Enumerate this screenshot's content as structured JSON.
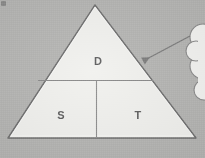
{
  "figure": {
    "type": "pyramid-diagram",
    "title": "",
    "background_color": "#b5b5b3",
    "shape_fill_color": "#f1f1ee",
    "shape_stroke_color": "#6f6f6f",
    "label_color": "#5e5e5e",
    "annotation_color": "#7d7d7d"
  },
  "pyramid": {
    "apex": {
      "x": 95,
      "y": 5
    },
    "base_left": {
      "x": 8,
      "y": 138
    },
    "base_right": {
      "x": 196,
      "y": 138
    },
    "horizontal_divider_y": 80,
    "vertical_divider_x": 96,
    "sections": [
      {
        "id": "top",
        "label": "D",
        "label_x": 98,
        "label_y": 61
      },
      {
        "id": "bottom-left",
        "label": "S",
        "label_x": 61,
        "label_y": 115
      },
      {
        "id": "bottom-right",
        "label": "T",
        "label_x": 138,
        "label_y": 115
      }
    ]
  },
  "annotation": {
    "arrow": {
      "name": "callout-arrow",
      "from_x": 190,
      "from_y": 36,
      "to_x": 140,
      "to_y": 62,
      "color": "#7d7d7d"
    },
    "callout": {
      "name": "cloud-callout",
      "shape": "cloud",
      "text": "",
      "fill_color": "#f3f3f1",
      "stroke_color": "#8a8a8a",
      "clipped": "right-edge"
    }
  }
}
